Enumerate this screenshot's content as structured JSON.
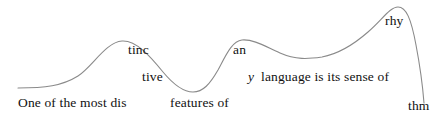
{
  "figure": {
    "full_sentence": "One of the most distinctive features of any language is its sense of rhythm",
    "background_color": "#ffffff",
    "curve_color": "#8a8a8a",
    "text_color": "#111111",
    "width": 442,
    "height": 123
  },
  "chart_data": {
    "type": "line",
    "xlabel": "",
    "ylabel": "",
    "xlim": [
      0,
      442
    ],
    "ylim": [
      0,
      123
    ],
    "grid": false,
    "legend": "none",
    "series": [
      {
        "name": "rhythm-contour",
        "x": [
          18,
          40,
          62,
          80,
          100,
          122,
          145,
          165,
          180,
          193,
          207,
          222,
          240,
          258,
          280,
          300,
          320,
          340,
          360,
          380,
          397,
          410,
          418,
          424
        ],
        "y": [
          88,
          87,
          83,
          76,
          58,
          41,
          47,
          66,
          82,
          92,
          86,
          62,
          41,
          40,
          46,
          53,
          58,
          56,
          45,
          22,
          7,
          22,
          60,
          103
        ]
      }
    ],
    "annotations": [
      {
        "text": "One of the most dis",
        "x": 18,
        "y": 105
      },
      {
        "text": "tinc",
        "x": 128,
        "y": 52
      },
      {
        "text": "tive",
        "x": 142,
        "y": 79
      },
      {
        "text": "features of",
        "x": 170,
        "y": 105
      },
      {
        "text": "an",
        "x": 233,
        "y": 52
      },
      {
        "text": "y",
        "x": 248,
        "y": 79,
        "style": "italic"
      },
      {
        "text": "language is its sense of",
        "x": 261,
        "y": 79
      },
      {
        "text": "rhy",
        "x": 385,
        "y": 23
      },
      {
        "text": "thm",
        "x": 408,
        "y": 108
      }
    ]
  },
  "fragments": [
    {
      "name": "fragment-one-of-the-most-dis",
      "text": "One of the most dis",
      "left": 18,
      "top": 96,
      "italic": false,
      "size": 13.5
    },
    {
      "name": "fragment-tinc",
      "text": "tinc",
      "left": 128,
      "top": 43,
      "italic": false,
      "size": 13.5
    },
    {
      "name": "fragment-tive",
      "text": "tive",
      "left": 142,
      "top": 70,
      "italic": false,
      "size": 13.5
    },
    {
      "name": "fragment-features-of",
      "text": "features of",
      "left": 170,
      "top": 96,
      "italic": false,
      "size": 13.5
    },
    {
      "name": "fragment-an",
      "text": "an",
      "left": 233,
      "top": 43,
      "italic": false,
      "size": 13.5
    },
    {
      "name": "fragment-y",
      "text": "y",
      "left": 248,
      "top": 70,
      "italic": true,
      "size": 13.5
    },
    {
      "name": "fragment-language-is-its-sense-of",
      "text": "language is its sense of",
      "left": 261,
      "top": 70,
      "italic": false,
      "size": 13.5
    },
    {
      "name": "fragment-rhy",
      "text": "rhy",
      "left": 385,
      "top": 14,
      "italic": false,
      "size": 13.5
    },
    {
      "name": "fragment-thm",
      "text": "thm",
      "left": 408,
      "top": 99,
      "italic": false,
      "size": 13.5
    }
  ],
  "curve": {
    "name": "rhythm-contour-path",
    "stroke": "#8a8a8a",
    "stroke_width": 1.1,
    "path": "M 18 88 C 45 88 62 86 78 76 C 92 67 106 42 122 41 C 136 40 150 56 163 72 C 173 84 183 92 193 92 C 203 92 210 84 218 70 C 226 55 232 41 242 40 C 254 39 266 47 280 53 C 296 60 308 59 322 57 C 338 54 352 46 368 32 C 382 20 390 7 398 7 C 406 7 411 18 416 45 C 420 66 423 90 424 103"
  }
}
